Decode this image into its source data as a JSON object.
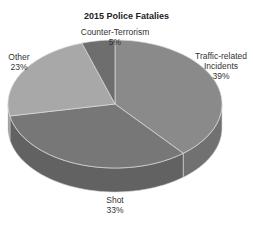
{
  "chart_data": {
    "type": "pie",
    "style": "3d",
    "title": "2015 Police Fatalies",
    "slices": [
      {
        "label": "Traffic-related Incidents",
        "value": 39,
        "display": "39%",
        "color": "#8a8a8a"
      },
      {
        "label": "Shot",
        "value": 33,
        "display": "33%",
        "color": "#777777"
      },
      {
        "label": "Other",
        "value": 23,
        "display": "23%",
        "color": "#a8a8a8"
      },
      {
        "label": "Counter-Terrorism",
        "value": 5,
        "display": "5%",
        "color": "#6e6e6e"
      }
    ],
    "start_angle_deg": 0,
    "direction": "clockwise"
  },
  "labels": {
    "title": "2015 Police Fatalies",
    "traffic_line1": "Traffic-related",
    "traffic_line2": "Incidents",
    "traffic_pct": "39%",
    "shot_line1": "Shot",
    "shot_pct": "33%",
    "other_line1": "Other",
    "other_pct": "23%",
    "ct_line1": "Counter-Terrorism",
    "ct_pct": "5%"
  }
}
